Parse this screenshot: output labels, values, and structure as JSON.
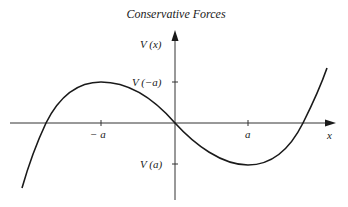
{
  "title": "Conservative Forces",
  "axes": {
    "y_label": "V (x)",
    "x_label": "x"
  },
  "ticks": {
    "x": [
      {
        "label": "− a",
        "position": "-a"
      },
      {
        "label": "a",
        "position": "a"
      }
    ],
    "y": [
      {
        "label": "V (−a)",
        "position": "V(-a)"
      },
      {
        "label": "V (a)",
        "position": "V(a)"
      }
    ]
  },
  "curve": {
    "description": "Cubic potential curve: rises from lower-left, crosses x-axis left of -a, local maximum at x=-a (V(-a)), passes through origin, local minimum at x=a (V(a)), rises steeply to the upper right after crossing x-axis beyond a",
    "color": "#1a1a1a"
  }
}
